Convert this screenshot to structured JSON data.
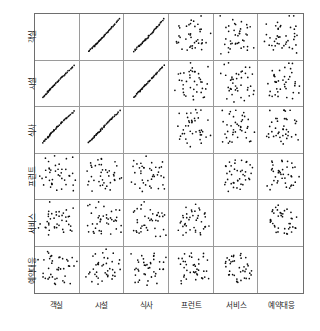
{
  "variables": [
    "객실",
    "시설",
    "식사",
    "프런트",
    "서비스",
    "예약대응"
  ],
  "axis_labels": {
    "bottom": [
      "객실",
      "시설",
      "식사",
      "프런트",
      "서비스",
      "예약대응"
    ],
    "left": [
      "객실",
      "시설",
      "식사",
      "프런트",
      "서비스",
      "예약대응"
    ]
  },
  "style": {
    "point_color": "#0d0d0d",
    "grid_color": "#9a9a9a",
    "frame_color": "#6e6e6e",
    "background": "#ffffff",
    "point_radius": 1.9
  },
  "chart_data": {
    "type": "scatter",
    "title": "",
    "xlabel": "",
    "ylabel": "",
    "layout": "scatter-plot-matrix",
    "matrix_size": 6,
    "diagonal": "empty",
    "grid": true,
    "legend": "none",
    "xlim": [
      0,
      100
    ],
    "ylim": [
      0,
      100
    ],
    "variables": [
      "객실",
      "시설",
      "식사",
      "프런트",
      "서비스",
      "예약대응"
    ],
    "points": {
      "객실": [
        18,
        22,
        20,
        26,
        24,
        30,
        28,
        33,
        31,
        36,
        34,
        40,
        38,
        43,
        41,
        47,
        44,
        50,
        48,
        55,
        53,
        60,
        58,
        66,
        63,
        71,
        68,
        76,
        73,
        82,
        78,
        86,
        84,
        90,
        29,
        45,
        61,
        35,
        52,
        70
      ],
      "시설": [
        20,
        24,
        22,
        28,
        27,
        32,
        30,
        36,
        34,
        39,
        37,
        43,
        41,
        46,
        44,
        50,
        47,
        54,
        51,
        58,
        56,
        63,
        61,
        68,
        66,
        73,
        70,
        78,
        75,
        83,
        80,
        87,
        85,
        91,
        33,
        48,
        64,
        38,
        55,
        72
      ],
      "식사": [
        22,
        26,
        25,
        30,
        29,
        34,
        32,
        38,
        36,
        41,
        39,
        45,
        43,
        48,
        46,
        52,
        49,
        56,
        54,
        60,
        58,
        65,
        63,
        70,
        68,
        75,
        72,
        80,
        77,
        84,
        82,
        88,
        86,
        92,
        36,
        50,
        66,
        41,
        57,
        74
      ],
      "프런트": [
        55,
        30,
        72,
        41,
        64,
        22,
        80,
        48,
        35,
        68,
        59,
        26,
        75,
        44,
        88,
        33,
        62,
        51,
        70,
        38,
        84,
        28,
        66,
        45,
        57,
        79,
        34,
        69,
        47,
        60,
        25,
        82,
        52,
        40,
        73,
        31,
        63,
        86,
        43,
        56
      ],
      "서비스": [
        40,
        68,
        27,
        81,
        52,
        35,
        74,
        60,
        44,
        29,
        86,
        55,
        38,
        70,
        47,
        63,
        32,
        78,
        50,
        42,
        66,
        24,
        85,
        58,
        36,
        72,
        46,
        61,
        31,
        77,
        54,
        43,
        69,
        26,
        80,
        49,
        64,
        37,
        59,
        71
      ],
      "예약대응": [
        62,
        34,
        77,
        45,
        28,
        70,
        53,
        88,
        39,
        66,
        48,
        25,
        82,
        57,
        36,
        74,
        43,
        60,
        30,
        85,
        51,
        67,
        38,
        79,
        46,
        33,
        71,
        55,
        42,
        64,
        27,
        81,
        50,
        59,
        35,
        73,
        44,
        68,
        31,
        76
      ]
    },
    "pair_correlations": [
      {
        "x": "객실",
        "y": "시설",
        "r": 0.95,
        "pattern": "tight positive linear"
      },
      {
        "x": "객실",
        "y": "식사",
        "r": 0.92,
        "pattern": "tight positive linear"
      },
      {
        "x": "객실",
        "y": "프런트",
        "r": 0.12,
        "pattern": "diffuse cloud"
      },
      {
        "x": "객실",
        "y": "서비스",
        "r": 0.08,
        "pattern": "diffuse cloud"
      },
      {
        "x": "객실",
        "y": "예약대응",
        "r": 0.1,
        "pattern": "diffuse cloud"
      },
      {
        "x": "시설",
        "y": "식사",
        "r": 0.93,
        "pattern": "tight positive linear"
      },
      {
        "x": "시설",
        "y": "프런트",
        "r": 0.15,
        "pattern": "diffuse cloud"
      },
      {
        "x": "시설",
        "y": "서비스",
        "r": 0.11,
        "pattern": "diffuse cloud"
      },
      {
        "x": "시설",
        "y": "예약대응",
        "r": 0.14,
        "pattern": "diffuse cloud"
      },
      {
        "x": "식사",
        "y": "프런트",
        "r": 0.18,
        "pattern": "diffuse cloud"
      },
      {
        "x": "식사",
        "y": "서비스",
        "r": 0.16,
        "pattern": "diffuse cloud"
      },
      {
        "x": "식사",
        "y": "예약대응",
        "r": 0.13,
        "pattern": "diffuse cloud"
      },
      {
        "x": "프런트",
        "y": "서비스",
        "r": 0.62,
        "pattern": "moderate positive"
      },
      {
        "x": "프런트",
        "y": "예약대응",
        "r": 0.58,
        "pattern": "moderate positive"
      },
      {
        "x": "서비스",
        "y": "예약대응",
        "r": 0.74,
        "pattern": "strong positive with cluster"
      }
    ]
  }
}
